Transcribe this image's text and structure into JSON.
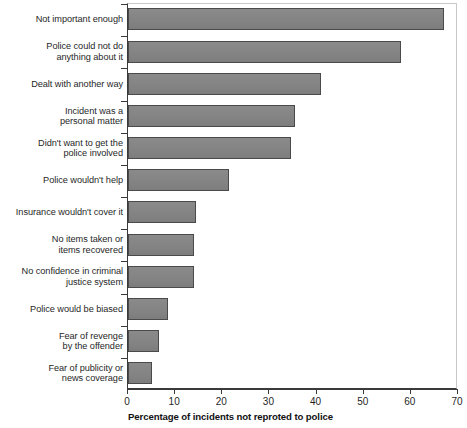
{
  "chart_data": {
    "type": "bar",
    "orientation": "horizontal",
    "title": "",
    "xlabel": "Percentage of incidents not reproted to police",
    "ylabel": "",
    "xlim": [
      0,
      70
    ],
    "ylim": null,
    "grid": false,
    "legend": null,
    "xticks": [
      0,
      10,
      20,
      30,
      40,
      50,
      60,
      70
    ],
    "xtick_labels": [
      "0",
      "10",
      "20",
      "30",
      "40",
      "50",
      "60",
      "70"
    ],
    "bar_color": "#858585",
    "bar_edge_color": "#4a4a4a",
    "categories": [
      "Not important enough",
      "Police could not do anything about it",
      "Dealt with another way",
      "Incident was a personal matter",
      "Didn't want to get the police involved",
      "Police wouldn't help",
      "Insurance wouldn't cover it",
      "No items taken or items recovered",
      "No confidence in criminal justice system",
      "Police would be biased",
      "Fear of revenge by the offender",
      "Fear of publicity or news coverage"
    ],
    "category_lines": [
      [
        "Not important enough"
      ],
      [
        "Police could not do",
        "anything about it"
      ],
      [
        "Dealt with another way"
      ],
      [
        "Incident was a",
        "personal matter"
      ],
      [
        "Didn't want to get the",
        "police involved"
      ],
      [
        "Police wouldn't help"
      ],
      [
        "Insurance wouldn't cover it"
      ],
      [
        "No items taken or",
        "items recovered"
      ],
      [
        "No confidence in criminal",
        "justice system"
      ],
      [
        "Police would be biased"
      ],
      [
        "Fear of revenge",
        "by the offender"
      ],
      [
        "Fear of publicity or",
        "news coverage"
      ]
    ],
    "values": [
      67,
      58,
      41,
      35.5,
      34.5,
      21.5,
      14.5,
      14,
      14,
      8.5,
      6.5,
      5
    ]
  }
}
